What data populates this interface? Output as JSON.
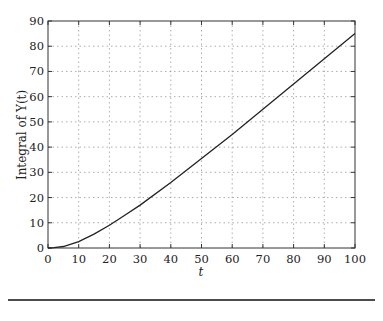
{
  "chart_data": {
    "type": "line",
    "title": "",
    "xlabel": "t",
    "ylabel": "Integral of Y(t)",
    "xlim": [
      0,
      100
    ],
    "ylim": [
      0,
      90
    ],
    "grid": true,
    "xticks": [
      0,
      10,
      20,
      30,
      40,
      50,
      60,
      70,
      80,
      90,
      100
    ],
    "yticks": [
      0,
      10,
      20,
      30,
      40,
      50,
      60,
      70,
      80,
      90
    ],
    "series": [
      {
        "name": "Integral of Y(t)",
        "x": [
          0,
          2,
          5,
          10,
          15,
          20,
          25,
          30,
          40,
          50,
          60,
          70,
          80,
          90,
          100
        ],
        "values": [
          0,
          0.1,
          0.6,
          2.5,
          5.5,
          9,
          13,
          17,
          26,
          35.5,
          45,
          55,
          65,
          75,
          85
        ]
      }
    ]
  }
}
